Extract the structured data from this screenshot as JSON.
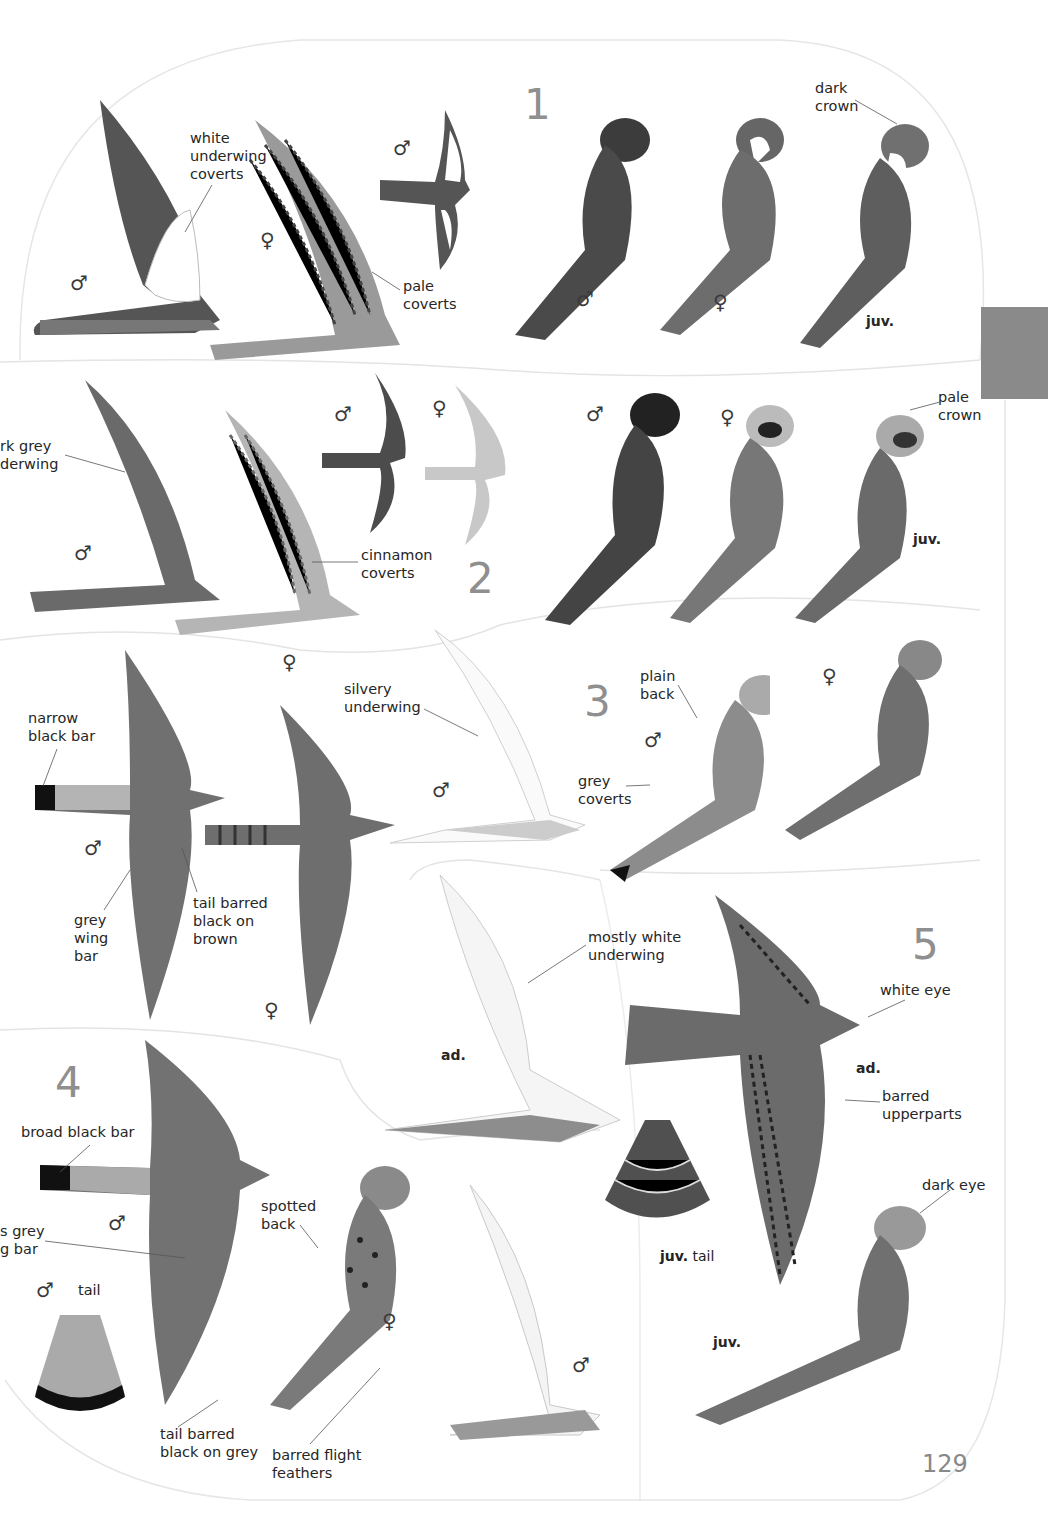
{
  "page": {
    "page_number": "129",
    "thumb_tab_color": "#8a8a8a"
  },
  "species_numbers": [
    "1",
    "2",
    "3",
    "4",
    "5"
  ],
  "sex_symbols": {
    "male": "♂",
    "female": "♀"
  },
  "plate_1": {
    "flight_male_label": "♂",
    "flight_female_label": "♀",
    "small_flight_male_label": "♂",
    "annotation_white_underwing": "white\nunderwing\ncoverts",
    "annotation_pale_coverts": "pale\ncoverts",
    "annotation_dark_crown": "dark\ncrown",
    "perched_male_label": "♂",
    "perched_female_label": "♀",
    "perched_juv_label": "juv."
  },
  "plate_2": {
    "annotation_dark_grey_underwing": "rk grey\nderwing",
    "annotation_cinnamon_coverts": "cinnamon\ncoverts",
    "annotation_pale_crown": "pale\ncrown",
    "flight_male_label": "♂",
    "small_flight_male_label": "♂",
    "small_flight_female_label": "♀",
    "perched_male_label": "♂",
    "perched_female_label": "♀",
    "perched_juv_label": "juv.",
    "female_below_label": "♀"
  },
  "plate_3": {
    "annotation_narrow_black_bar": "narrow\nblack bar",
    "annotation_grey_wing_bar": "grey\nwing\nbar",
    "annotation_tail_barred_brown": "tail barred\nblack on\nbrown",
    "annotation_silvery_underwing": "silvery\nunderwing",
    "annotation_plain_back": "plain\nback",
    "annotation_grey_coverts": "grey\ncoverts",
    "flight_male_label": "♂",
    "flight_female_label": "♀",
    "underwing_male_label": "♂",
    "perched_male_label": "♂",
    "perched_female_label": "♀"
  },
  "plate_4": {
    "annotation_broad_black_bar": "broad black bar",
    "annotation_grey_wing_bar": "s grey\ng bar",
    "annotation_spotted_back": "spotted\nback",
    "annotation_tail_barred_grey": "tail barred\nblack on grey",
    "annotation_barred_flight_feathers": "barred flight\nfeathers",
    "tail_label": "tail",
    "tail_sex_label": "♂",
    "flight_male_label": "♂",
    "perched_female_label": "♀",
    "underwing_male_label": "♂"
  },
  "plate_5": {
    "annotation_mostly_white_underwing": "mostly white\nunderwing",
    "annotation_white_eye": "white eye",
    "annotation_barred_upperparts": "barred\nupperparts",
    "annotation_dark_eye": "dark eye",
    "underwing_ad_label": "ad.",
    "upper_ad_label": "ad.",
    "juv_tail_label_bold": "juv.",
    "juv_tail_label": "tail",
    "perched_juv_label": "juv."
  }
}
